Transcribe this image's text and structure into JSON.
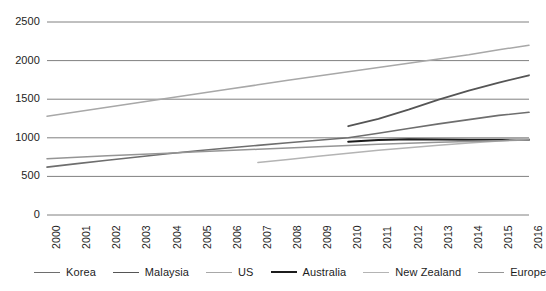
{
  "chart_data": {
    "type": "line",
    "title": "",
    "subtitle": "",
    "xlabel": "",
    "ylabel": "",
    "grid": true,
    "legend_position": "bottom",
    "xlim": [
      2000,
      2016
    ],
    "ylim": [
      0,
      2500
    ],
    "yticks": [
      0,
      500,
      1000,
      1500,
      2000,
      2500
    ],
    "ytick_labels": [
      "0",
      "500",
      "1000",
      "1500",
      "2000",
      "2500"
    ],
    "x": [
      2000,
      2001,
      2002,
      2003,
      2004,
      2005,
      2006,
      2007,
      2008,
      2009,
      2010,
      2011,
      2012,
      2013,
      2014,
      2015,
      2016
    ],
    "xtick_labels": [
      "2000",
      "2001",
      "2002",
      "2003",
      "2004",
      "2005",
      "2006",
      "2007",
      "2008",
      "2009",
      "2010",
      "2011",
      "2012",
      "2013",
      "2014",
      "2015",
      "2016"
    ],
    "series": [
      {
        "name": "Korea",
        "color": "#6e6e6e",
        "width": 1.6,
        "x": [
          2000,
          2001,
          2002,
          2003,
          2004,
          2005,
          2006,
          2007,
          2008,
          2009,
          2010,
          2011,
          2012,
          2013,
          2014,
          2015,
          2016
        ],
        "values": [
          620,
          665,
          710,
          752,
          793,
          832,
          868,
          902,
          935,
          968,
          1000,
          1060,
          1120,
          1180,
          1235,
          1290,
          1330
        ]
      },
      {
        "name": "Malaysia",
        "color": "#555555",
        "width": 1.8,
        "x": [
          2010,
          2011,
          2012,
          2013,
          2014,
          2015,
          2016
        ],
        "values": [
          1150,
          1245,
          1365,
          1495,
          1610,
          1715,
          1810
        ]
      },
      {
        "name": "US",
        "color": "#a8a8a8",
        "width": 1.5,
        "x": [
          2000,
          2001,
          2002,
          2003,
          2004,
          2005,
          2006,
          2007,
          2008,
          2009,
          2010,
          2011,
          2012,
          2013,
          2014,
          2015,
          2016
        ],
        "values": [
          1280,
          1338,
          1396,
          1454,
          1512,
          1570,
          1628,
          1686,
          1744,
          1800,
          1855,
          1910,
          1965,
          2020,
          2075,
          2140,
          2200
        ]
      },
      {
        "name": "Australia",
        "color": "#1c1c1c",
        "width": 2.0,
        "x": [
          2010,
          2011,
          2012,
          2013,
          2014,
          2015,
          2016
        ],
        "values": [
          950,
          972,
          980,
          978,
          976,
          975,
          975
        ]
      },
      {
        "name": "New Zealand",
        "color": "#b4b4b4",
        "width": 1.5,
        "x": [
          2007,
          2008,
          2009,
          2010,
          2011,
          2012,
          2013,
          2014,
          2015,
          2016
        ],
        "values": [
          680,
          720,
          760,
          800,
          838,
          872,
          902,
          932,
          960,
          985
        ]
      },
      {
        "name": "Europe",
        "color": "#959595",
        "width": 1.5,
        "x": [
          2000,
          2001,
          2002,
          2003,
          2004,
          2005,
          2006,
          2007,
          2008,
          2009,
          2010,
          2011,
          2012,
          2013,
          2014,
          2015,
          2016
        ],
        "values": [
          730,
          748,
          766,
          784,
          800,
          818,
          835,
          852,
          868,
          884,
          900,
          915,
          928,
          941,
          953,
          963,
          970
        ]
      }
    ]
  },
  "legend": {
    "items": [
      {
        "label": "Korea"
      },
      {
        "label": "Malaysia"
      },
      {
        "label": "US"
      },
      {
        "label": "Australia"
      },
      {
        "label": "New Zealand"
      },
      {
        "label": "Europe"
      }
    ]
  },
  "axis_colors": {
    "gridline": "#808080",
    "text": "#1d1d1d"
  }
}
